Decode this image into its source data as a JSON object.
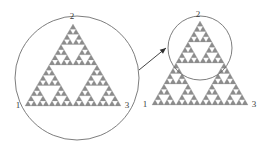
{
  "figure": {
    "background_color": "#ffffff",
    "stroke_color": "#6e6e6e",
    "fractal_fill_color": "#8c8c8c",
    "label_color": "#3a3a3a"
  },
  "left_panel": {
    "circle": {
      "cx": 77,
      "cy": 78,
      "r": 62,
      "label": "magnifier-circle-left"
    },
    "triangle": {
      "apex": {
        "x": 73,
        "y": 24
      },
      "left": {
        "x": 25,
        "y": 106
      },
      "right": {
        "x": 121,
        "y": 106
      },
      "depth": 4
    },
    "vertex_labels": [
      {
        "text": "1",
        "x": 18,
        "y": 108
      },
      {
        "text": "2",
        "x": 72,
        "y": 19
      },
      {
        "text": "3",
        "x": 127,
        "y": 108
      }
    ]
  },
  "arrow": {
    "x1": 139,
    "y1": 70,
    "x2": 166,
    "y2": 48,
    "label": "zoom-arrow"
  },
  "right_panel": {
    "circle": {
      "cx": 200,
      "cy": 48,
      "r": 32,
      "label": "magnifier-circle-right"
    },
    "triangle": {
      "apex": {
        "x": 200,
        "y": 21
      },
      "left": {
        "x": 152,
        "y": 105
      },
      "right": {
        "x": 248,
        "y": 105
      },
      "depth": 4
    },
    "vertex_labels": [
      {
        "text": "1",
        "x": 145,
        "y": 107
      },
      {
        "text": "2",
        "x": 198,
        "y": 17
      },
      {
        "text": "3",
        "x": 254,
        "y": 107
      }
    ]
  }
}
